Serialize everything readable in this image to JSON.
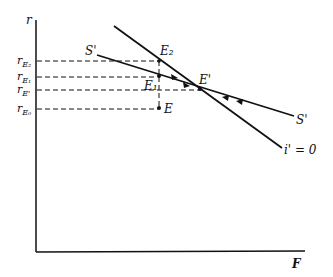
{
  "axes": {
    "y_label": "r",
    "x_label": "F"
  },
  "y_ticks": [
    {
      "base": "r",
      "sub": "E₂",
      "y": 61
    },
    {
      "base": "r",
      "sub": "E₁",
      "y": 77
    },
    {
      "base": "r",
      "sub": "E'",
      "y": 90
    },
    {
      "base": "r",
      "sub": "E₀",
      "y": 109
    }
  ],
  "curves": {
    "s_prime": {
      "label_left": "S'",
      "label_right": "S'"
    },
    "i_prime": {
      "label": "i' = 0"
    }
  },
  "points": {
    "E2": "E₂",
    "E1": "E₁",
    "E_prime": "E'",
    "E": "E"
  },
  "colors": {
    "ink": "#111111",
    "background": "#ffffff"
  }
}
